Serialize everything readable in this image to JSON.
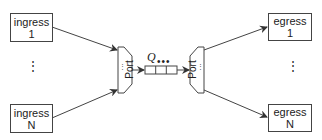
{
  "diagram": {
    "ingress": [
      {
        "label": "ingress",
        "index": "1"
      },
      {
        "label": "ingress",
        "index": "N"
      }
    ],
    "egress": [
      {
        "label": "egress",
        "index": "1"
      },
      {
        "label": "egress",
        "index": "N"
      }
    ],
    "ellipsis_vertical": "⋮",
    "ports": {
      "left": {
        "label": "Port",
        "inner_dots": "⋮"
      },
      "right": {
        "label": "Port",
        "inner_dots": "⋮"
      }
    },
    "queue": {
      "label": "Q",
      "dots": "•••",
      "cells": 3
    },
    "colors": {
      "stroke": "#444444",
      "text": "#222222",
      "background": "#ffffff"
    }
  }
}
